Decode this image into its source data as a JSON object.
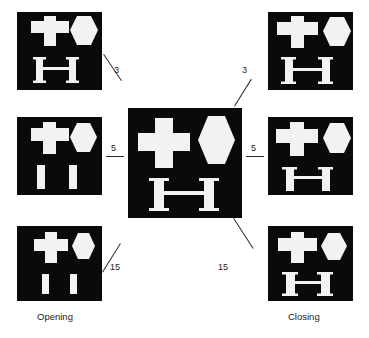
{
  "figure": {
    "background_color": "#ffffff",
    "panel_background_color": "#0a0a0a",
    "shape_fill_color": "#f2f2f2",
    "line_color": "#2b2b2b",
    "text_color": "#1a1a1a"
  },
  "captions": {
    "left": "Opening",
    "right": "Closing"
  },
  "edges": [
    {
      "label": "3",
      "side": "left",
      "x": 111,
      "y": 71
    },
    {
      "label": "5",
      "side": "left",
      "x": 110,
      "y": 148
    },
    {
      "label": "15",
      "side": "left",
      "x": 109,
      "y": 258
    },
    {
      "label": "3",
      "side": "right",
      "x": 245,
      "y": 71
    },
    {
      "label": "5",
      "side": "right",
      "x": 245,
      "y": 148
    },
    {
      "label": "15",
      "side": "right",
      "x": 240,
      "y": 258
    }
  ],
  "panels": [
    {
      "id": "opening-3",
      "name": "opening-radius-3-panel",
      "column": "left",
      "row": 0,
      "structuring_element_size": "3",
      "operation": "Opening",
      "shapes": [
        "cross",
        "hexagon",
        "h-bar"
      ]
    },
    {
      "id": "opening-5",
      "name": "opening-radius-5-panel",
      "column": "left",
      "row": 1,
      "structuring_element_size": "5",
      "operation": "Opening",
      "shapes": [
        "cross",
        "hexagon",
        "two-bars"
      ]
    },
    {
      "id": "opening-15",
      "name": "opening-radius-15-panel",
      "column": "left",
      "row": 2,
      "structuring_element_size": "15",
      "operation": "Opening",
      "shapes": [
        "cross",
        "hexagon",
        "two-short-bars"
      ]
    },
    {
      "id": "original",
      "name": "original-image-panel",
      "column": "center",
      "row": 1,
      "structuring_element_size": "",
      "operation": "Original",
      "shapes": [
        "cross",
        "hexagon",
        "h-bar"
      ]
    },
    {
      "id": "closing-3",
      "name": "closing-radius-3-panel",
      "column": "right",
      "row": 0,
      "structuring_element_size": "3",
      "operation": "Closing",
      "shapes": [
        "cross",
        "hexagon",
        "h-bar"
      ]
    },
    {
      "id": "closing-5",
      "name": "closing-radius-5-panel",
      "column": "right",
      "row": 1,
      "structuring_element_size": "5",
      "operation": "Closing",
      "shapes": [
        "cross",
        "hexagon",
        "h-bar"
      ]
    },
    {
      "id": "closing-15",
      "name": "closing-radius-15-panel",
      "column": "right",
      "row": 2,
      "structuring_element_size": "15",
      "operation": "Closing",
      "shapes": [
        "cross",
        "hexagon",
        "h-bar"
      ]
    }
  ]
}
